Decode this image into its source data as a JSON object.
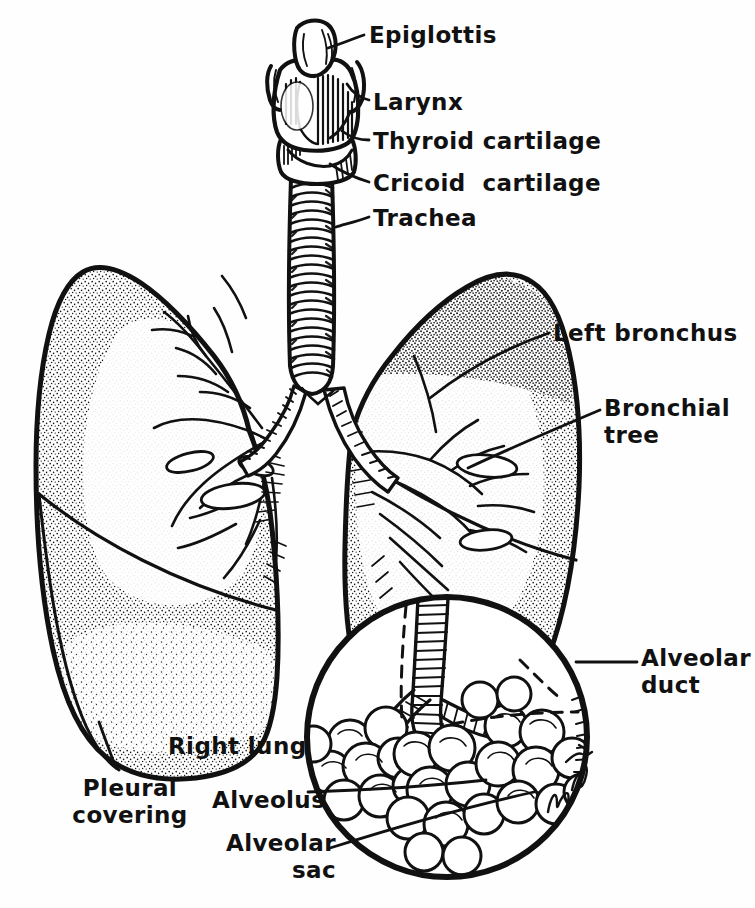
{
  "figure": {
    "background_color": "#fefefe",
    "ink_color": "#111111",
    "signature": "MBirnn '70"
  },
  "labels": [
    {
      "id": "epiglottis",
      "text": "Epiglottis",
      "x": 369,
      "y": 22,
      "lines": 1
    },
    {
      "id": "larynx",
      "text": "Larynx",
      "x": 373,
      "y": 89,
      "lines": 1
    },
    {
      "id": "thyroid-cartilage",
      "text": "Thyroid cartilage",
      "x": 373,
      "y": 128,
      "lines": 1
    },
    {
      "id": "cricoid-cartilage",
      "text": "Cricoid  cartilage",
      "x": 373,
      "y": 170,
      "lines": 1
    },
    {
      "id": "trachea",
      "text": "Trachea",
      "x": 373,
      "y": 205,
      "lines": 1
    },
    {
      "id": "left-bronchus",
      "text": "Left bronchus",
      "x": 553,
      "y": 320,
      "lines": 1
    },
    {
      "id": "bronchial-tree",
      "text": "Bronchial\ntree",
      "x": 604,
      "y": 395,
      "lines": 2
    },
    {
      "id": "alveolar-duct",
      "text": "Alveolar\nduct",
      "x": 641,
      "y": 645,
      "lines": 2
    },
    {
      "id": "right-lung",
      "text": "Right lung",
      "x": 168,
      "y": 733,
      "lines": 1
    },
    {
      "id": "pleural-covering",
      "text": "Pleural\ncovering",
      "x": 65,
      "y": 775,
      "lines": 2
    },
    {
      "id": "alveolus",
      "text": "Alveolus",
      "x": 212,
      "y": 787,
      "lines": 1
    },
    {
      "id": "alveolar-sac",
      "text": "Alveolar\nsac",
      "x": 236,
      "y": 830,
      "lines": 2
    }
  ],
  "structures": {
    "epiglottis": "epiglottis-cartilage",
    "larynx": "larynx-body",
    "thyroid_cartilage": "thyroid-cartilage-plate",
    "cricoid_cartilage": "cricoid-cartilage-ring",
    "trachea": "trachea-tube-with-rings",
    "right_lung": "right-lung-outline",
    "left_lung": "left-lung-outline",
    "right_bronchus": "right-primary-bronchus",
    "left_bronchus": "left-primary-bronchus",
    "bronchial_tree": "bronchial-tree-branches",
    "magnifier": "alveoli-magnification-circle",
    "alveolar_duct": "alveolar-duct-tube",
    "alveolar_sacs": "alveolar-sac-clusters",
    "pleura": "pleural-covering-layer"
  },
  "counts": {
    "trachea_rings": 22,
    "alveolar_clusters": 5,
    "leader_lines": 12
  }
}
